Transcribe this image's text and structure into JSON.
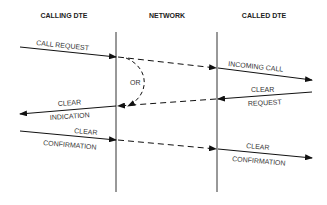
{
  "headers": {
    "calling": "CALLING DTE",
    "network": "NETWORK",
    "called": "CALLED DTE"
  },
  "labels": {
    "call_request": "CALL REQUEST",
    "or": "OR",
    "incoming_call": "INCOMING CALL",
    "clear_request_1": "CLEAR",
    "clear_request_2": "REQUEST",
    "clear_indication_1": "CLEAR",
    "clear_indication_2": "INDICATION",
    "clear_conf_left_1": "CLEAR",
    "clear_conf_left_2": "CONFIRMATION",
    "clear_conf_right_1": "CLEAR",
    "clear_conf_right_2": "CONFIRMATION"
  }
}
